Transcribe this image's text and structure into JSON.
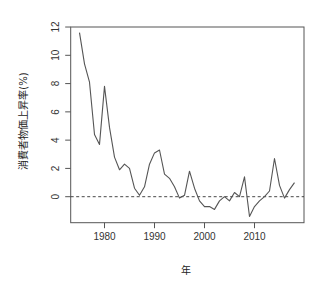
{
  "chart_data": {
    "type": "line",
    "title": "",
    "xlabel": "年",
    "ylabel": "消費者物価上昇率(%)",
    "xlim": [
      1970,
      2020
    ],
    "ylim": [
      -2,
      12
    ],
    "x_ticks": [
      1980,
      1990,
      2000,
      2010
    ],
    "y_ticks": [
      0,
      2,
      4,
      6,
      8,
      10,
      12
    ],
    "grid": false,
    "legend": null,
    "reference_line": {
      "y": 0,
      "style": "dashed"
    },
    "series": [
      {
        "name": "消費者物価上昇率",
        "x": [
          1975,
          1976,
          1977,
          1978,
          1979,
          1980,
          1981,
          1982,
          1983,
          1984,
          1985,
          1986,
          1987,
          1988,
          1989,
          1990,
          1991,
          1992,
          1993,
          1994,
          1995,
          1996,
          1997,
          1998,
          1999,
          2000,
          2001,
          2002,
          2003,
          2004,
          2005,
          2006,
          2007,
          2008,
          2009,
          2010,
          2011,
          2012,
          2013,
          2014,
          2015,
          2016,
          2017,
          2018
        ],
        "values": [
          11.6,
          9.4,
          8.1,
          4.4,
          3.7,
          7.8,
          4.9,
          2.8,
          1.9,
          2.3,
          2.0,
          0.6,
          0.1,
          0.7,
          2.3,
          3.1,
          3.3,
          1.6,
          1.3,
          0.7,
          -0.1,
          0.1,
          1.8,
          0.6,
          -0.3,
          -0.7,
          -0.7,
          -0.9,
          -0.3,
          0.0,
          -0.3,
          0.3,
          0.0,
          1.4,
          -1.4,
          -0.7,
          -0.3,
          0.0,
          0.4,
          2.7,
          0.8,
          -0.1,
          0.5,
          1.0
        ]
      }
    ]
  },
  "colors": {
    "line": "#555555",
    "axis": "#555555",
    "reference": "#333333"
  }
}
